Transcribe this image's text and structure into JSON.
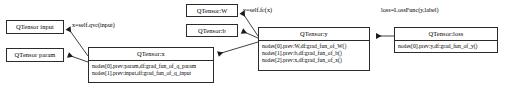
{
  "diagram": {
    "stroke_color": "#2b2b2b",
    "background_color": "#ffffff",
    "nodes": {
      "input": {
        "title": "QTensor input"
      },
      "param": {
        "title": "QTensor param"
      },
      "x": {
        "title": "QTensor:x",
        "rows": [
          "nodes[0].prev:param,df:grad_fun_of_q_param",
          "nodes[1].prev:input,df:grad_fun_of_q_input"
        ]
      },
      "w": {
        "title": "QTensor:W"
      },
      "b": {
        "title": "QTensor:b"
      },
      "y": {
        "title": "QTensor:y",
        "rows": [
          "nodes[0].prev:W,df:grad_fun_of_W()",
          "nodes[1].prev:b,df:grad_fun_of_b()",
          "nodes[2].prev:x,df:grad_fun_of_x()"
        ]
      },
      "loss": {
        "title": "QTensor:loss",
        "rows": [
          "nodes[0].prev:y,df:grad_fun_of_y()"
        ]
      }
    },
    "edge_labels": {
      "x": "x=self.qvc(input)",
      "y": "y=self.fc(x)",
      "loss": "loss=LossFunc(y,label)"
    }
  }
}
